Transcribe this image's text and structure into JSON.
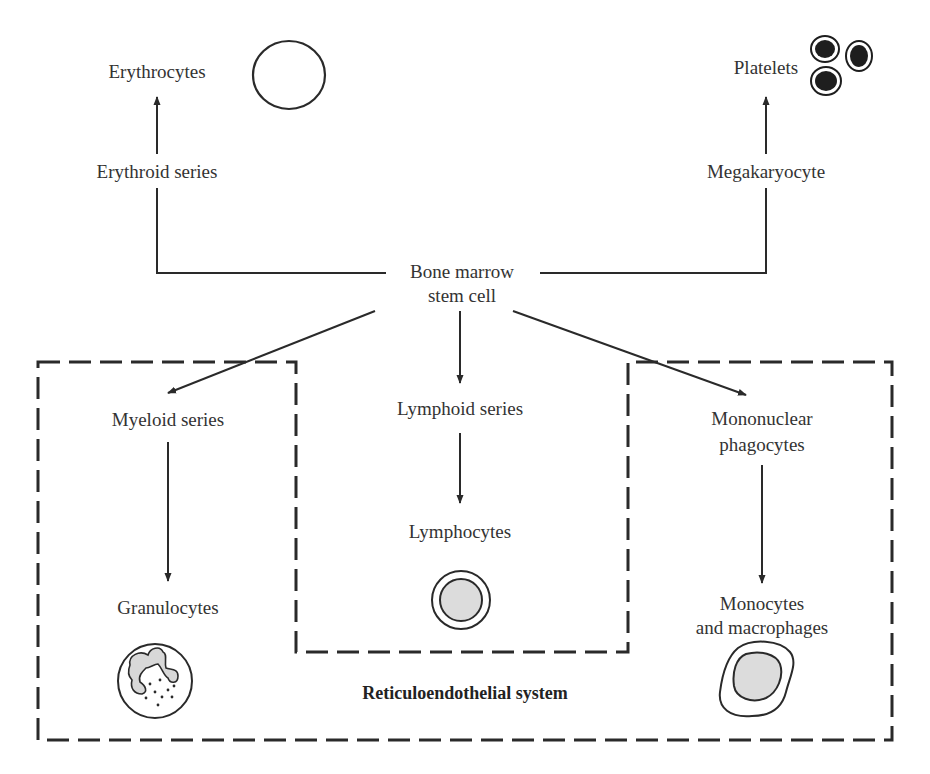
{
  "diagram": {
    "type": "flow",
    "root": {
      "label_line1": "Bone marrow",
      "label_line2": "stem cell"
    },
    "upper_branches": {
      "left": {
        "intermediate": "Erythroid series",
        "product": "Erythrocytes",
        "cell_icon": "erythrocyte-icon"
      },
      "right": {
        "intermediate": "Megakaryocyte",
        "product": "Platelets",
        "cell_icon": "platelets-icon"
      }
    },
    "lower_branches": {
      "left": {
        "intermediate": "Myeloid series",
        "product": "Granulocytes",
        "cell_icon": "granulocyte-icon"
      },
      "center": {
        "intermediate": "Lymphoid series",
        "product": "Lymphocytes",
        "cell_icon": "lymphocyte-icon"
      },
      "right": {
        "intermediate_line1": "Mononuclear",
        "intermediate_line2": "phagocytes",
        "product_line1": "Monocytes",
        "product_line2": "and macrophages",
        "cell_icon": "macrophage-icon"
      }
    },
    "region_label": "Reticuloendothelial system",
    "colors": {
      "line": "#2a2a2a",
      "nucleus_fill": "#dcdcdc",
      "platelet_fill": "#1e1e1e"
    }
  }
}
